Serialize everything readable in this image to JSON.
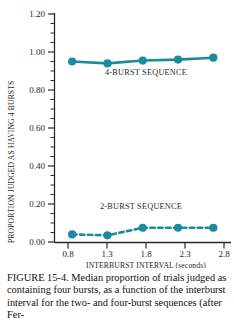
{
  "chart_data": {
    "type": "line",
    "title": "",
    "xlabel": "INTERBURST INTERVAL (seconds)",
    "ylabel": "PROPORTION JUDGED AS HAVING 4 BURSTS",
    "x": [
      0.8,
      1.3,
      1.8,
      2.3,
      2.8
    ],
    "xticklabels": [
      "0.8",
      "1.3",
      "1.8",
      "2.3",
      "2.8"
    ],
    "yticklabels": [
      "0.00",
      "0.20",
      "0.40",
      "0.60",
      "0.80",
      "1.00",
      "1.20"
    ],
    "yticks": [
      0.0,
      0.2,
      0.4,
      0.6,
      0.8,
      1.0,
      1.2
    ],
    "ylim": [
      0.0,
      1.2
    ],
    "xlim": [
      0.55,
      3.05
    ],
    "minor_tick_step": 0.05,
    "grid": false,
    "legend": "inline-annotations",
    "series": [
      {
        "name": "4-BURST SEQUENCE",
        "style": "solid",
        "color": "#1a8c9e",
        "values": [
          0.95,
          0.94,
          0.955,
          0.96,
          0.97
        ]
      },
      {
        "name": "2-BURST SEQUENCE",
        "style": "dashed",
        "color": "#1a8c9e",
        "values": [
          0.04,
          0.035,
          0.075,
          0.075,
          0.075
        ]
      }
    ],
    "annotations": [
      {
        "text": "4-BURST SEQUENCE",
        "x": 2.0,
        "y": 0.845
      },
      {
        "text": "2-BURST SEQUENCE",
        "x": 1.86,
        "y": 0.195
      }
    ]
  },
  "caption": {
    "lines": [
      "FIGURE 15-4. Median proportion of trials",
      "judged as containing four bursts, as a",
      "function of the interburst interval for the",
      "two- and four-burst sequences (after Fer-"
    ],
    "full": "FIGURE 15-4. Median proportion of trials judged as containing four bursts, as a function of the interburst interval for the two- and four-burst sequences (after Fer-"
  }
}
